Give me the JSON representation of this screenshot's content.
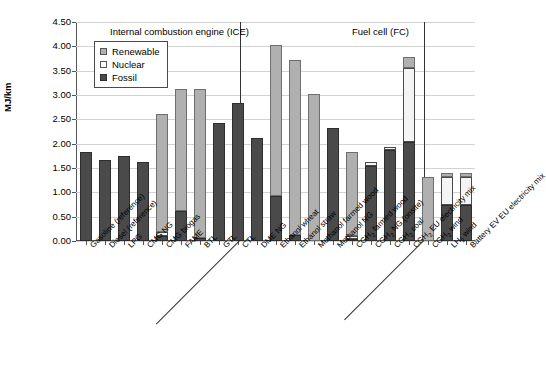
{
  "chart_data": {
    "type": "bar",
    "stacked": true,
    "title": "",
    "xlabel": "",
    "ylabel": "MJ/km",
    "ylim": [
      0.0,
      4.5
    ],
    "ytick_labels": [
      "0.00",
      "0.50",
      "1.00",
      "1.50",
      "2.00",
      "2.50",
      "3.00",
      "3.50",
      "4.00",
      "4.50"
    ],
    "ytick_values": [
      0.0,
      0.5,
      1.0,
      1.5,
      2.0,
      2.5,
      3.0,
      3.5,
      4.0,
      4.5
    ],
    "grid": true,
    "legend_position": "upper-left-inside",
    "legend": [
      "Renewable",
      "Nuclear",
      "Fossil"
    ],
    "series": [
      {
        "name": "Fossil",
        "color": "#4a4a4a",
        "values": [
          1.83,
          1.67,
          1.74,
          1.63,
          0.1,
          0.61,
          0.07,
          2.42,
          2.83,
          2.12,
          0.92,
          0.12,
          0.0,
          2.33,
          0.05,
          1.55,
          1.87,
          2.03,
          0.0,
          0.73
        ]
      },
      {
        "name": "Nuclear",
        "color": "#f4f4f4",
        "values": [
          0.0,
          0.0,
          0.0,
          0.0,
          0.09,
          0.0,
          0.0,
          0.0,
          0.0,
          0.0,
          0.0,
          0.0,
          0.0,
          0.0,
          0.06,
          0.07,
          0.07,
          1.52,
          0.0,
          0.58
        ]
      },
      {
        "name": "Renewable",
        "color": "#b0b0b0",
        "values": [
          0.0,
          0.0,
          0.0,
          0.0,
          2.41,
          2.51,
          3.05,
          0.0,
          0.0,
          0.0,
          3.11,
          3.61,
          3.03,
          0.0,
          1.72,
          0.0,
          0.0,
          0.23,
          1.32,
          0.09
        ]
      }
    ],
    "categories": [
      "Gasoline (reference)",
      "Diesel (reference)",
      "LPG",
      "CMG NG",
      "CMG biogas",
      "FAME",
      "BTL",
      "GTL",
      "CTL",
      "DME  NG",
      "Ethanol wheat",
      "Ethanol straw",
      "Methanol farmed wood",
      "Methanol  NG",
      "CGH2 farmed wood",
      "CGH2 NG (onsite)",
      "CGH2 coal",
      "CGH2 EU electricity mix",
      "CGH2 wind",
      "LH2 wind"
    ],
    "category_parts": [
      {
        "pre": "Gasoline (reference)",
        "sub": "",
        "post": ""
      },
      {
        "pre": "Diesel (reference)",
        "sub": "",
        "post": ""
      },
      {
        "pre": "LPG",
        "sub": "",
        "post": ""
      },
      {
        "pre": "CMG NG",
        "sub": "",
        "post": ""
      },
      {
        "pre": "CMG biogas",
        "sub": "",
        "post": ""
      },
      {
        "pre": "FAME",
        "sub": "",
        "post": ""
      },
      {
        "pre": "BTL",
        "sub": "",
        "post": ""
      },
      {
        "pre": "GTL",
        "sub": "",
        "post": ""
      },
      {
        "pre": "CTL",
        "sub": "",
        "post": ""
      },
      {
        "pre": "DME  NG",
        "sub": "",
        "post": ""
      },
      {
        "pre": "Ethanol wheat",
        "sub": "",
        "post": ""
      },
      {
        "pre": "Ethanol straw",
        "sub": "",
        "post": ""
      },
      {
        "pre": "Methanol farmed wood",
        "sub": "",
        "post": ""
      },
      {
        "pre": "Methanol  NG",
        "sub": "",
        "post": ""
      },
      {
        "pre": "CGH",
        "sub": "2",
        "post": " farmed wood"
      },
      {
        "pre": "CGH",
        "sub": "2",
        "post": " NG (onsite)"
      },
      {
        "pre": "CGH",
        "sub": "2",
        "post": " coal"
      },
      {
        "pre": "CGH",
        "sub": "2",
        "post": " EU electricity mix"
      },
      {
        "pre": "CGH",
        "sub": "2",
        "post": " wind"
      },
      {
        "pre": "LH",
        "sub": "2",
        "post": " wind"
      }
    ],
    "extra_category": {
      "pre": "Battery EV EU electricity mix",
      "sub": "",
      "post": ""
    },
    "annotations": [
      {
        "text": "Internal combustion engine (ICE)",
        "x_left_px": 110,
        "y_px": 26
      },
      {
        "text": "Fuel cell (FC)",
        "x_left_px": 352,
        "y_px": 26
      }
    ],
    "group_dividers_px": [
      240,
      424
    ]
  },
  "colors": {
    "fossil": "#4a4a4a",
    "nuclear": "#f4f4f4",
    "renewable": "#b0b0b0",
    "grid": "#d2d2d2",
    "axis": "#555555",
    "background": "#ffffff"
  }
}
